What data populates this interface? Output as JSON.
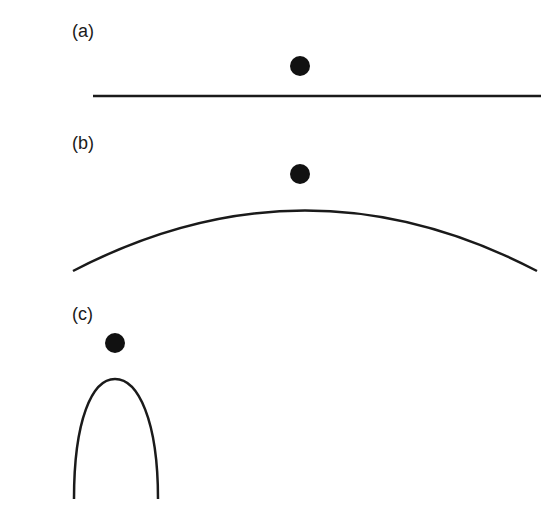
{
  "panels": [
    {
      "id": "a",
      "label": "(a)",
      "surface": "flat line",
      "point": "dot above flat surface"
    },
    {
      "id": "b",
      "label": "(b)",
      "surface": "gently curved convex arc",
      "point": "dot above arc apex"
    },
    {
      "id": "c",
      "label": "(c)",
      "surface": "sharply curved tip",
      "point": "dot above sharp tip"
    }
  ],
  "colors": {
    "stroke": "#1a1a1a",
    "dot": "#111111",
    "background": "#ffffff"
  }
}
